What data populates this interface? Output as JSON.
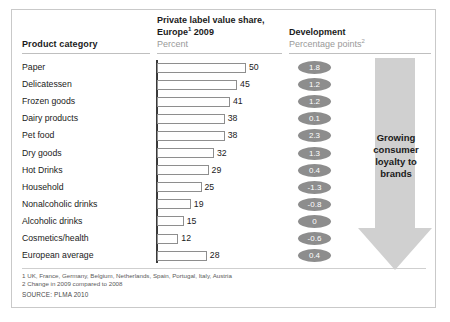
{
  "header": {
    "category_label": "Product category",
    "share_title": "Private label value share,\nEurope¹ 2009",
    "share_title_line1": "Private label value share,",
    "share_title_line2": "Europe",
    "share_title_sup": "1",
    "share_title_year": " 2009",
    "share_unit": "Percent",
    "development_label": "Development",
    "development_unit": "Percentage points",
    "development_unit_sup": "2"
  },
  "callout": {
    "text_line1": "Growing",
    "text_line2": "consumer",
    "text_line3": "loyalty to",
    "text_line4": "brands",
    "arrow_color": "#d0d0d0",
    "direction": "down"
  },
  "footer": {
    "footnote1": "1 UK, France, Germany, Belgium, Netherlands, Spain, Portugal, Italy, Austria",
    "footnote2": "2 Change in 2009 compared to 2008",
    "source": "SOURCE: PLMA 2010"
  },
  "colors": {
    "bar_fill": "#ffffff",
    "bar_border": "#8e8e8e",
    "pill_fill": "#8d8d8d",
    "pill_text": "#ffffff",
    "axis": "#3a3a3a",
    "frame": "#c9c9c9"
  },
  "chart_data": {
    "type": "bar",
    "subtitle": "Percent",
    "xlabel": "",
    "ylabel": "Product category",
    "orientation": "horizontal",
    "xlim": [
      0,
      50
    ],
    "grid": false,
    "legend": "none",
    "categories": [
      "Paper",
      "Delicatessen",
      "Frozen goods",
      "Dairy products",
      "Pet food",
      "Dry goods",
      "Hot Drinks",
      "Household",
      "Nonalcoholic drinks",
      "Alcoholic drinks",
      "Cosmetics/health",
      "European average"
    ],
    "values": [
      50,
      45,
      41,
      38,
      38,
      32,
      29,
      25,
      19,
      15,
      12,
      28
    ],
    "value_labels": [
      "50",
      "45",
      "41",
      "38",
      "38",
      "32",
      "29",
      "25",
      "19",
      "15",
      "12",
      "28"
    ],
    "series": [
      {
        "name": "Private label value share, Europe 2009 (Percent)",
        "values": [
          50,
          45,
          41,
          38,
          38,
          32,
          29,
          25,
          19,
          15,
          12,
          28
        ]
      },
      {
        "name": "Development (Percentage points, 2009 vs 2008)",
        "values": [
          1.8,
          1.2,
          1.2,
          0.1,
          2.3,
          1.3,
          0.4,
          -1.3,
          -0.8,
          0,
          -0.6,
          0.4
        ],
        "labels": [
          "1.8",
          "1.2",
          "1.2",
          "0.1",
          "2.3",
          "1.3",
          "0.4",
          "-1.3",
          "-0.8",
          "0",
          "-0.6",
          "0.4"
        ]
      }
    ]
  }
}
